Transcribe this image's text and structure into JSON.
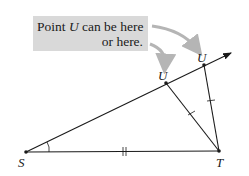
{
  "callout": {
    "text_before": "Point ",
    "variable": "U",
    "text_after": " can be here",
    "line2": "or here."
  },
  "points": {
    "S": {
      "label": "S",
      "x": 26,
      "y": 152
    },
    "T": {
      "label": "T",
      "x": 219,
      "y": 151
    },
    "U1": {
      "label": "U",
      "x": 166,
      "y": 83
    },
    "U2": {
      "label": "U",
      "x": 204,
      "y": 65
    }
  },
  "colors": {
    "line": "#1a1a1a",
    "callout_bg": "#d9d9d9",
    "arrow": "#b5b5b5"
  },
  "marks": {
    "ST": "double tick",
    "TU": "single tick (congruent segments)",
    "angle_S": "arc"
  }
}
